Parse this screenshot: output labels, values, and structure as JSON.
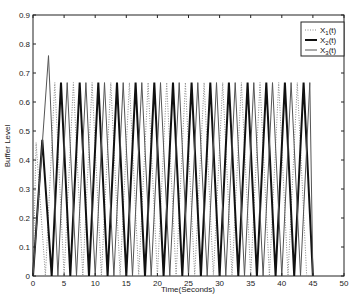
{
  "chart_data": {
    "type": "line",
    "title": "",
    "xlabel": "Time(Seconds)",
    "ylabel": "Buffer Level",
    "xlim": [
      0,
      50
    ],
    "ylim": [
      0,
      0.9
    ],
    "xticks": [
      0,
      5,
      10,
      15,
      20,
      25,
      30,
      35,
      40,
      45,
      50
    ],
    "yticks": [
      0,
      0.1,
      0.2,
      0.3,
      0.4,
      0.5,
      0.6,
      0.7,
      0.8,
      0.9
    ],
    "grid": false,
    "legend_position": "upper right",
    "series": [
      {
        "name": "X1(t)",
        "label_main": "X",
        "label_sub": "1",
        "label_suffix": "(t)",
        "style": "dotted",
        "color": "#888888",
        "width": 1,
        "period": 3.0,
        "phase": 0.5,
        "peak": 0.667,
        "first_peak": 0.46,
        "end_time": 45,
        "end_value": 0.0
      },
      {
        "name": "X2(t)",
        "label_main": "X",
        "label_sub": "2",
        "label_suffix": "(t)",
        "style": "solid",
        "color": "#111111",
        "width": 2,
        "period": 3.0,
        "phase": 1.5,
        "peak": 0.667,
        "first_peak": 0.47,
        "end_time": 45,
        "end_value": 0.33
      },
      {
        "name": "X3(t)",
        "label_main": "X",
        "label_sub": "3",
        "label_suffix": "(t)",
        "style": "solid",
        "color": "#555555",
        "width": 1,
        "period": 3.0,
        "phase": 2.5,
        "peak": 0.667,
        "first_peak": 0.76,
        "end_time": 45,
        "end_value": 0.0
      }
    ]
  }
}
